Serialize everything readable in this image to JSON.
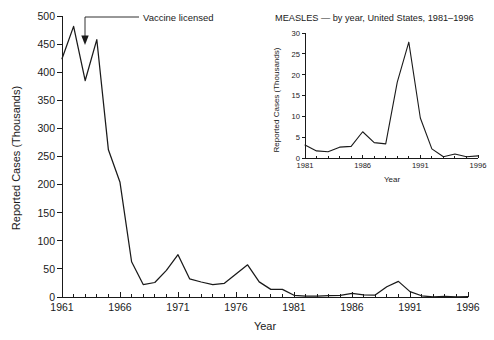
{
  "chart_data": [
    {
      "id": "main",
      "type": "line",
      "title": "",
      "xlabel": "Year",
      "ylabel": "Reported Cases (Thousands)",
      "xlim": [
        1961,
        1996
      ],
      "ylim": [
        0,
        500
      ],
      "xticks": [
        1961,
        1966,
        1971,
        1976,
        1981,
        1986,
        1991,
        1996
      ],
      "xticklabels": [
        "1961",
        "1966",
        "1971",
        "1976",
        "1981",
        "1986",
        "1991",
        "1996"
      ],
      "yticks": [
        0,
        50,
        100,
        150,
        200,
        250,
        300,
        350,
        400,
        450,
        500
      ],
      "yticklabels": [
        "0",
        "50",
        "100",
        "150",
        "200",
        "250",
        "300",
        "350",
        "400",
        "450",
        "500"
      ],
      "minor_xtick_interval": 1,
      "grid": false,
      "legend": "none",
      "series": [
        {
          "name": "Measles reported cases",
          "x": [
            1961,
            1962,
            1963,
            1964,
            1965,
            1966,
            1967,
            1968,
            1969,
            1970,
            1971,
            1972,
            1973,
            1974,
            1975,
            1976,
            1977,
            1978,
            1979,
            1980,
            1981,
            1982,
            1983,
            1984,
            1985,
            1986,
            1987,
            1988,
            1989,
            1990,
            1991,
            1992,
            1993,
            1994,
            1995,
            1996
          ],
          "y": [
            423.9,
            481.5,
            385.2,
            458.1,
            261.9,
            204.1,
            62.7,
            22.2,
            25.8,
            47.4,
            75.3,
            32.3,
            26.7,
            22.1,
            24.4,
            41.1,
            57.3,
            26.9,
            13.6,
            13.5,
            3.1,
            1.7,
            1.5,
            2.6,
            2.8,
            6.3,
            3.7,
            3.4,
            18.2,
            27.8,
            9.6,
            2.2,
            0.3,
            0.96,
            0.3,
            0.5
          ]
        }
      ],
      "annotations": [
        {
          "label": "Vaccine licensed",
          "at_year": 1963,
          "type": "arrow-with-leader-line"
        }
      ]
    },
    {
      "id": "inset",
      "type": "line",
      "title": "MEASLES — by year, United States, 1981–1996",
      "xlabel": "Year",
      "ylabel": "Reported Cases (Thousands)",
      "xlim": [
        1981,
        1996
      ],
      "ylim": [
        0,
        30
      ],
      "xticks": [
        1981,
        1986,
        1991,
        1996
      ],
      "xticklabels": [
        "1981",
        "1986",
        "1991",
        "1996"
      ],
      "yticks": [
        0,
        5,
        10,
        15,
        20,
        25,
        30
      ],
      "yticklabels": [
        "0",
        "5",
        "10",
        "15",
        "20",
        "25",
        "30"
      ],
      "minor_xtick_interval": 1,
      "grid": false,
      "legend": "none",
      "series": [
        {
          "name": "Measles reported cases",
          "x": [
            1981,
            1982,
            1983,
            1984,
            1985,
            1986,
            1987,
            1988,
            1989,
            1990,
            1991,
            1992,
            1993,
            1994,
            1995,
            1996
          ],
          "y": [
            3.1,
            1.7,
            1.5,
            2.6,
            2.8,
            6.3,
            3.7,
            3.4,
            18.2,
            27.8,
            9.6,
            2.2,
            0.3,
            0.96,
            0.3,
            0.5
          ]
        }
      ]
    }
  ],
  "colors": {
    "line": "#1a1a1a",
    "axis": "#1a1a1a",
    "background": "#ffffff"
  }
}
